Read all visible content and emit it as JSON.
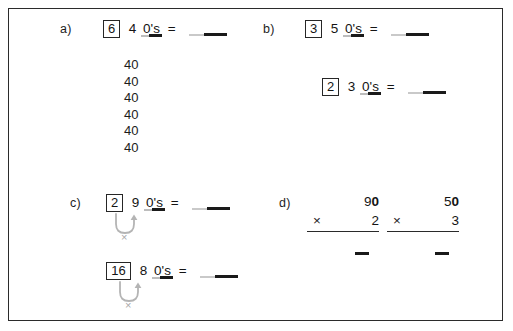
{
  "page": {
    "border_color": "#2b2b2b",
    "background": "#ffffff",
    "ink_color": "#141414",
    "blank_dark": "#1a1a1a",
    "blank_light": "#c9c9c9",
    "arrow_color": "#b0b0b0"
  },
  "sections": {
    "a": {
      "label": "a)",
      "boxed_digit": "6",
      "multiplicand": "4",
      "zeros_word": "0's",
      "equals": "=",
      "addends": [
        "40",
        "40",
        "40",
        "40",
        "40",
        "40"
      ]
    },
    "b": {
      "label": "b)",
      "rows": [
        {
          "boxed_digit": "3",
          "multiplicand": "5",
          "zeros_word": "0's",
          "equals": "="
        },
        {
          "boxed_digit": "2",
          "multiplicand": "3",
          "zeros_word": "0's",
          "equals": "="
        }
      ]
    },
    "c": {
      "label": "c)",
      "rows": [
        {
          "boxed_digit": "2",
          "multiplicand": "9",
          "zeros_word": "0's",
          "equals": "=",
          "arrow_symbol": "×"
        },
        {
          "boxed_digit": "16",
          "multiplicand": "8",
          "zeros_word": "0's",
          "equals": "=",
          "arrow_symbol": "×"
        }
      ]
    },
    "d": {
      "label": "d)",
      "problems": [
        {
          "top_tens": "9",
          "top_zero": "0",
          "operator": "×",
          "multiplier": "2"
        },
        {
          "top_tens": "5",
          "top_zero": "0",
          "operator": "×",
          "multiplier": "3"
        }
      ]
    }
  }
}
